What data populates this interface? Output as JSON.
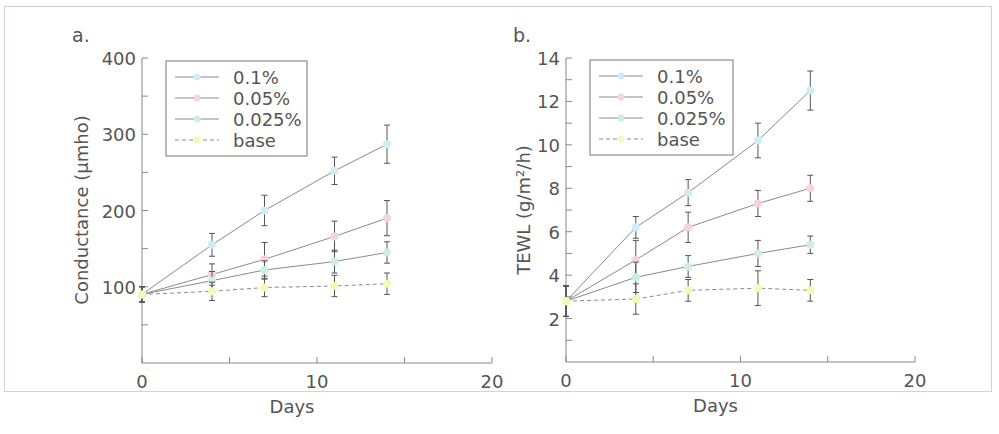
{
  "figure": {
    "panels": [
      {
        "id": "a",
        "label": "a."
      },
      {
        "id": "b",
        "label": "b."
      }
    ]
  },
  "colors": {
    "axis": "#888888",
    "line": "#8a8a8a",
    "errorbar": "#555555",
    "series": {
      "0.1%": "#cdeef6",
      "0.05%": "#f7d3de",
      "0.025%": "#cdeee3",
      "base": "#f7f7b8"
    }
  },
  "chart_data": [
    {
      "type": "line",
      "panel": "a.",
      "title": "",
      "xlabel": "Days",
      "ylabel": "Conductance (μmho)",
      "xlim": [
        0,
        20
      ],
      "ylim": [
        0,
        400
      ],
      "xticks": [
        0,
        10,
        20
      ],
      "yticks": [
        100,
        200,
        300,
        400
      ],
      "minor_yticks": [
        50,
        150,
        250,
        350
      ],
      "minor_xticks": [
        5,
        15
      ],
      "grid": false,
      "legend_position": "upper left",
      "x": [
        0,
        4,
        7,
        11,
        14
      ],
      "series": [
        {
          "name": "0.1%",
          "style": "solid",
          "values": [
            90,
            155,
            200,
            252,
            287
          ],
          "errors": [
            10,
            15,
            20,
            18,
            25
          ]
        },
        {
          "name": "0.05%",
          "style": "solid",
          "values": [
            90,
            116,
            136,
            166,
            190
          ],
          "errors": [
            10,
            14,
            22,
            20,
            23
          ]
        },
        {
          "name": "0.025%",
          "style": "solid",
          "values": [
            90,
            108,
            122,
            133,
            145
          ],
          "errors": [
            10,
            12,
            12,
            15,
            14
          ]
        },
        {
          "name": "base",
          "style": "dashed",
          "values": [
            90,
            94,
            99,
            101,
            104
          ],
          "errors": [
            10,
            12,
            12,
            14,
            14
          ]
        }
      ]
    },
    {
      "type": "line",
      "panel": "b.",
      "title": "",
      "xlabel": "Days",
      "ylabel": "TEWL (g/m²/h)",
      "xlim": [
        0,
        20
      ],
      "ylim": [
        0,
        14
      ],
      "xticks": [
        0,
        10,
        20
      ],
      "yticks": [
        2,
        4,
        6,
        8,
        10,
        12,
        14
      ],
      "minor_yticks": [
        1,
        3,
        5,
        7,
        9,
        11,
        13
      ],
      "minor_xticks": [
        5,
        15
      ],
      "grid": false,
      "legend_position": "upper left",
      "x": [
        0,
        4,
        7,
        11,
        14
      ],
      "series": [
        {
          "name": "0.1%",
          "style": "solid",
          "values": [
            2.8,
            6.2,
            7.8,
            10.2,
            12.5
          ],
          "errors": [
            0.7,
            0.5,
            0.6,
            0.8,
            0.9
          ]
        },
        {
          "name": "0.05%",
          "style": "solid",
          "values": [
            2.8,
            4.7,
            6.2,
            7.3,
            8.0
          ],
          "errors": [
            0.7,
            0.9,
            0.7,
            0.6,
            0.6
          ]
        },
        {
          "name": "0.025%",
          "style": "solid",
          "values": [
            2.8,
            3.9,
            4.4,
            5.0,
            5.4
          ],
          "errors": [
            0.7,
            0.7,
            0.5,
            0.6,
            0.4
          ]
        },
        {
          "name": "base",
          "style": "dashed",
          "values": [
            2.8,
            2.9,
            3.3,
            3.4,
            3.3
          ],
          "errors": [
            0.7,
            0.7,
            0.5,
            0.8,
            0.5
          ]
        }
      ]
    }
  ]
}
